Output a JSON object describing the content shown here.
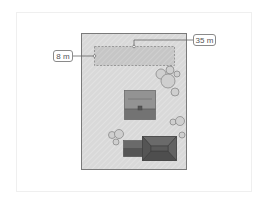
{
  "diagram": {
    "type": "site-plan",
    "colors": {
      "lot_fill": "#d9d9d9",
      "lot_border": "#7a7a7a",
      "strip_fill": "#c8c8c8",
      "tree_fill": "#cfcfcf",
      "tree_stroke": "#8a8a8a",
      "garage_roof": "#8f8f8f",
      "garage_front": "#6e6e6e",
      "house_roof": "#5a5a5a",
      "annex_roof": "#6a6a6a"
    },
    "dimensions": {
      "width_label": "8 m",
      "length_label": "35 m"
    }
  }
}
